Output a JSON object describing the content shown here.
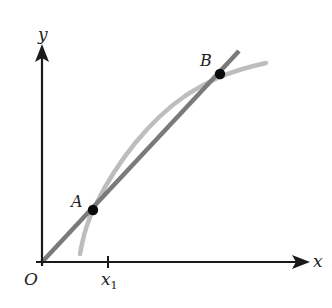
{
  "figure": {
    "axes": {
      "x_label": "x",
      "y_label": "y",
      "origin_label": "O",
      "tick_label": "x",
      "tick_subscript": "1"
    },
    "points": {
      "A": {
        "label": "A"
      },
      "B": {
        "label": "B"
      }
    },
    "colors": {
      "axis": "#1a1a1a",
      "secant_line": "#7a7a7a",
      "curve": "#bdbdbd",
      "points": "#0a0a0a"
    }
  }
}
